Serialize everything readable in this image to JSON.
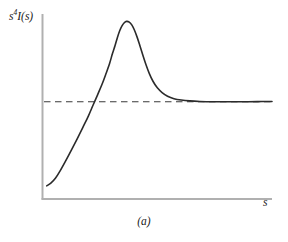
{
  "figure": {
    "caption": "(a)",
    "ylabel_base": "s",
    "ylabel_exponent": "4",
    "ylabel_rest": "I(s)",
    "ylabel_full": "s4I(s)",
    "xlabel": "s"
  },
  "style": {
    "axis_color": "#b0b0b0",
    "curve_color": "#2b2b2b",
    "asymptote_color": "#3a3a3a",
    "background": "#ffffff"
  },
  "chart_data": {
    "type": "line",
    "title": "",
    "subtitle": "",
    "xlabel": "s",
    "ylabel": "s4I(s)",
    "caption": "(a)",
    "grid": false,
    "legend": null,
    "axis_ticks": {
      "x": [],
      "y": []
    },
    "xlim": [
      0,
      1
    ],
    "ylim": [
      0,
      1
    ],
    "annotations": [
      {
        "name": "asymptote",
        "style": "dashed",
        "orientation": "horizontal",
        "y": 0.53,
        "x_start": 0.0,
        "x_end": 1.0,
        "description": "horizontal dashed asymptote that the curve approaches at large s"
      }
    ],
    "series": [
      {
        "name": "s4I(s)",
        "style": "solid",
        "description": "rises steeply from a low start, peaks sharply, then decays and converges onto the dashed asymptote",
        "points": [
          [
            0.012,
            0.047
          ],
          [
            0.03,
            0.062
          ],
          [
            0.05,
            0.09
          ],
          [
            0.07,
            0.131
          ],
          [
            0.095,
            0.19
          ],
          [
            0.12,
            0.252
          ],
          [
            0.145,
            0.316
          ],
          [
            0.17,
            0.382
          ],
          [
            0.195,
            0.449
          ],
          [
            0.215,
            0.51
          ],
          [
            0.235,
            0.57
          ],
          [
            0.255,
            0.632
          ],
          [
            0.272,
            0.692
          ],
          [
            0.288,
            0.752
          ],
          [
            0.3,
            0.806
          ],
          [
            0.312,
            0.855
          ],
          [
            0.322,
            0.9
          ],
          [
            0.332,
            0.938
          ],
          [
            0.342,
            0.966
          ],
          [
            0.352,
            0.984
          ],
          [
            0.362,
            0.992
          ],
          [
            0.374,
            0.988
          ],
          [
            0.385,
            0.972
          ],
          [
            0.396,
            0.944
          ],
          [
            0.408,
            0.903
          ],
          [
            0.42,
            0.855
          ],
          [
            0.433,
            0.8
          ],
          [
            0.447,
            0.744
          ],
          [
            0.462,
            0.692
          ],
          [
            0.478,
            0.648
          ],
          [
            0.497,
            0.61
          ],
          [
            0.518,
            0.583
          ],
          [
            0.542,
            0.562
          ],
          [
            0.57,
            0.548
          ],
          [
            0.602,
            0.54
          ],
          [
            0.64,
            0.535
          ],
          [
            0.684,
            0.532
          ],
          [
            0.735,
            0.53
          ],
          [
            0.795,
            0.53
          ],
          [
            0.862,
            0.53
          ],
          [
            0.935,
            0.531
          ],
          [
            1.0,
            0.532
          ]
        ]
      }
    ]
  }
}
